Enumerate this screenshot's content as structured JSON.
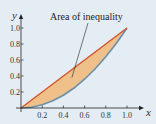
{
  "chart_data": {
    "type": "area",
    "title": "",
    "xlabel": "x",
    "ylabel": "y",
    "xlim": [
      0,
      1.0
    ],
    "ylim": [
      0,
      1.0
    ],
    "grid": false,
    "x_ticks": [
      "0.2",
      "0.4",
      "0.6",
      "0.8",
      "1.0"
    ],
    "x_tick_values": [
      0.2,
      0.4,
      0.6,
      0.8,
      1.0
    ],
    "y_ticks": [
      "0.2",
      "0.4",
      "0.6",
      "0.8",
      "1.0"
    ],
    "y_tick_values": [
      0.2,
      0.4,
      0.6,
      0.8,
      1.0
    ],
    "series": [
      {
        "name": "Line of equality",
        "x": [
          0,
          0.2,
          0.4,
          0.6,
          0.8,
          1.0
        ],
        "y": [
          0,
          0.2,
          0.4,
          0.6,
          0.8,
          1.0
        ],
        "color": "#d4532a"
      },
      {
        "name": "Lorenz curve",
        "x": [
          0,
          0.1,
          0.2,
          0.3,
          0.4,
          0.5,
          0.6,
          0.7,
          0.8,
          0.9,
          1.0
        ],
        "y": [
          0,
          0.01,
          0.04,
          0.09,
          0.16,
          0.25,
          0.36,
          0.49,
          0.64,
          0.81,
          1.0
        ],
        "color": "#6a8fa8"
      }
    ],
    "shaded_region": {
      "label": "Area of inequality",
      "fill": "#f0c08a"
    },
    "annotations": [
      {
        "text": "Area of inequality",
        "points_to": [
          0.48,
          0.38
        ]
      }
    ]
  }
}
